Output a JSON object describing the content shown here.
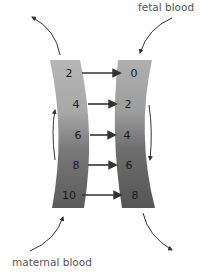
{
  "labels": {
    "fetal": "fetal blood",
    "maternal": "maternal blood"
  },
  "maternal_vessel": {
    "values": [
      "2",
      "4",
      "6",
      "8",
      "10"
    ],
    "flow_direction": "upward"
  },
  "fetal_vessel": {
    "values": [
      "0",
      "2",
      "4",
      "6",
      "8"
    ],
    "flow_direction": "downward"
  },
  "colors": {
    "vessel_light": "#b4b4b4",
    "vessel_dark": "#5e5e5e",
    "arrow": "#333333",
    "text": "#555555"
  }
}
